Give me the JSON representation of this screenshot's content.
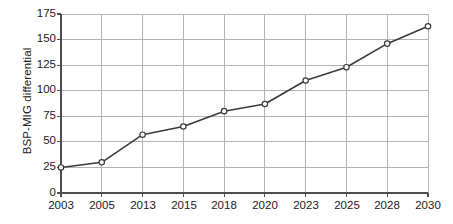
{
  "chart_data": {
    "type": "line",
    "title": "",
    "xlabel": "",
    "ylabel": "BSP-MIG differential",
    "categories": [
      "2003",
      "2005",
      "2013",
      "2015",
      "2018",
      "2020",
      "2023",
      "2025",
      "2028",
      "2030"
    ],
    "x": [
      2003,
      2005,
      2013,
      2015,
      2018,
      2020,
      2023,
      2025,
      2028,
      2030
    ],
    "values": [
      25,
      30,
      57,
      65,
      80,
      87,
      110,
      123,
      146,
      163
    ],
    "series": [
      {
        "name": "BSP-MIG differential",
        "values": [
          25,
          30,
          57,
          65,
          80,
          87,
          110,
          123,
          146,
          163
        ]
      }
    ],
    "ylim": [
      0,
      175
    ],
    "yticks": [
      0,
      25,
      50,
      75,
      100,
      125,
      150,
      175
    ],
    "ytick_labels": [
      "0",
      "25",
      "50",
      "75",
      "100",
      "125",
      "150",
      "175"
    ],
    "xticks": [
      "2003",
      "2005",
      "2013",
      "2015",
      "2018",
      "2020",
      "2023",
      "2025",
      "2028",
      "2030"
    ],
    "grid": true,
    "grid_axis": "both",
    "legend": false,
    "legend_position": "none",
    "marker": "open-circle",
    "line_color": "#3a3a3a",
    "marker_fill": "#ffffff",
    "grid_color": "#b3b3b3",
    "axis_color": "#4d4d4d",
    "background": "#ffffff"
  }
}
